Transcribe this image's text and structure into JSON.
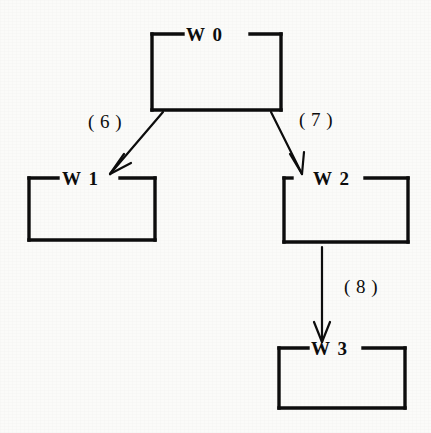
{
  "diagram": {
    "type": "tree-diagram",
    "background_color": "#fbfbf9",
    "ink_color": "#0d0d0d",
    "nodes": [
      {
        "id": "w0",
        "label": "W 0",
        "x": 152,
        "y": 33,
        "width": 129,
        "height": 78
      },
      {
        "id": "w1",
        "label": "W 1",
        "x": 28,
        "y": 177,
        "width": 127,
        "height": 64
      },
      {
        "id": "w2",
        "label": "W 2",
        "x": 283,
        "y": 177,
        "width": 125,
        "height": 66
      },
      {
        "id": "w3",
        "label": "W 3",
        "x": 278,
        "y": 347,
        "width": 127,
        "height": 62
      }
    ],
    "edges": [
      {
        "id": "e6",
        "label": "( 6 )",
        "from": "w0",
        "to": "w1"
      },
      {
        "id": "e7",
        "label": "( 7 )",
        "from": "w0",
        "to": "w2"
      },
      {
        "id": "e8",
        "label": "( 8 )",
        "from": "w2",
        "to": "w3"
      }
    ]
  }
}
